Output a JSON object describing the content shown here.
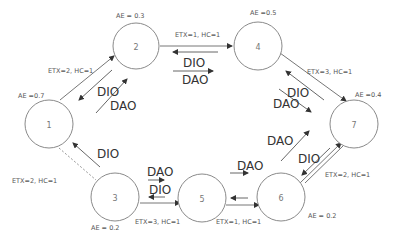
{
  "diagram": {
    "type": "RPL network topology",
    "nodes": [
      {
        "id": "1",
        "label": "1",
        "ae_label": "AE =0.7"
      },
      {
        "id": "2",
        "label": "2",
        "ae_label": "AE = 0.3"
      },
      {
        "id": "3",
        "label": "3",
        "ae_label": "AE = 0.2"
      },
      {
        "id": "4",
        "label": "4",
        "ae_label": "AE =0.5"
      },
      {
        "id": "5",
        "label": "5",
        "ae_label": ""
      },
      {
        "id": "6",
        "label": "6",
        "ae_label": "AE = 0.2"
      },
      {
        "id": "7",
        "label": "7",
        "ae_label": "AE =0.4"
      }
    ],
    "links": [
      {
        "from": "1",
        "to": "2",
        "label": "ETX=2, HC=1",
        "style": "solid"
      },
      {
        "from": "2",
        "to": "4",
        "label": "ETX=1, HC=1",
        "style": "solid"
      },
      {
        "from": "4",
        "to": "7",
        "label": "ETX=3, HC=1",
        "style": "solid"
      },
      {
        "from": "1",
        "to": "3",
        "label": "ETX=2, HC=1",
        "style": "dashed"
      },
      {
        "from": "3",
        "to": "5",
        "label": "ETX=3, HC=1",
        "style": "solid"
      },
      {
        "from": "5",
        "to": "6",
        "label": "ETX=1, HC=1",
        "style": "solid"
      },
      {
        "from": "6",
        "to": "7",
        "label": "ETX=2, HC=1",
        "style": "solid"
      }
    ],
    "messages": {
      "dio": "DIO",
      "dao": "DAO"
    }
  }
}
